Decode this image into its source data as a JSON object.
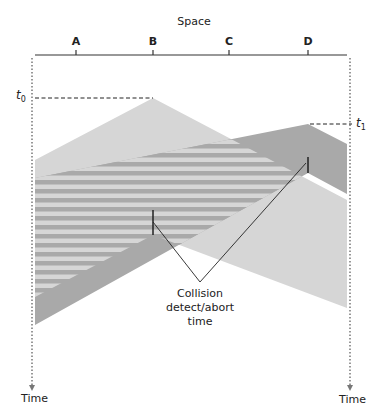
{
  "diagram": {
    "title": "Space",
    "stations": [
      {
        "label": "A",
        "x": 76
      },
      {
        "label": "B",
        "x": 153
      },
      {
        "label": "C",
        "x": 229
      },
      {
        "label": "D",
        "x": 308
      }
    ],
    "time_marks": {
      "t0": {
        "label": "t",
        "sub": "0"
      },
      "t1": {
        "label": "t",
        "sub": "1"
      }
    },
    "axis_labels": {
      "left_time": "Time",
      "right_time": "Time"
    },
    "annotation": {
      "line1": "Collision",
      "line2": "detect/abort",
      "line3": "time"
    },
    "colors": {
      "b_signal": "#d6d6d6",
      "d_signal": "#a9a9a9",
      "stripe_light": "#d6d6d6",
      "stripe_dark": "#a9a9a9",
      "lines": "#222222"
    }
  }
}
